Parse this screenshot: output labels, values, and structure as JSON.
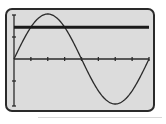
{
  "chart_data": {
    "type": "line",
    "title": "",
    "xlabel": "",
    "ylabel": "",
    "xlim": [
      0,
      6.2832
    ],
    "ylim": [
      -1.0,
      1.0
    ],
    "x_tick_step": 0.7854,
    "y_tick_step": 0.5,
    "grid": false,
    "legend": "none",
    "series": [
      {
        "name": "y = sin(x)",
        "function": "sin(x)",
        "style": "thin",
        "x": [
          0,
          0.7854,
          1.5708,
          2.3562,
          3.1416,
          3.927,
          4.7124,
          5.4978,
          6.2832
        ],
        "y": [
          0,
          0.707,
          1,
          0.707,
          0,
          -0.707,
          -1,
          -0.707,
          0
        ]
      },
      {
        "name": "y = 0.707",
        "function": "constant",
        "style": "thick",
        "x": [
          0,
          6.2832
        ],
        "y": [
          0.707,
          0.707
        ]
      }
    ]
  },
  "screen": {
    "background": "#dcdcdc",
    "border": "#2a2a2a",
    "curve_color": "#2b2b2b"
  }
}
